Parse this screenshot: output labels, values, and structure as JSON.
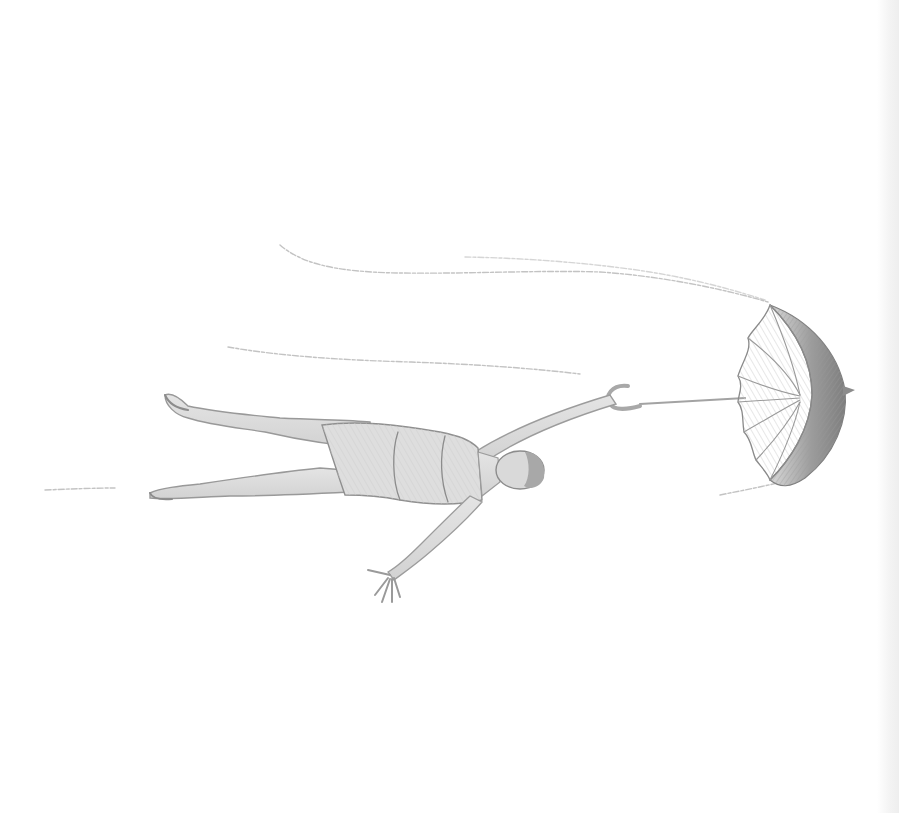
{
  "image": {
    "description": "Pencil sketch of a woman in a swimsuit floating horizontally through the air, holding an open umbrella that is being blown by the wind",
    "subjects": [
      "woman",
      "umbrella",
      "wind streaks"
    ],
    "style": "graphite pencil drawing",
    "colors": {
      "background": "#ffffff",
      "pencil_dark": "#7a7a7a",
      "pencil_mid": "#9a9a9a",
      "pencil_light": "#c4c4c4",
      "wind": "#b9b9b9"
    }
  }
}
